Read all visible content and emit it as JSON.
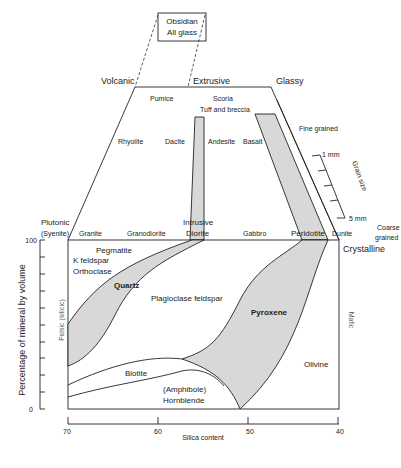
{
  "obsidian_box": {
    "line1": "Obsidian",
    "line2": "All glass"
  },
  "top_labels": {
    "volcanic": "Volcanic",
    "extrusive": "Extrusive",
    "glassy": "Glassy"
  },
  "volcanic_rocks": {
    "pumice": "Pumice",
    "scoria": "Scoria",
    "tuff": "Tuff and breccia",
    "rhyolite": "Rhyolite",
    "dacite": "Dacite",
    "andesite": "Andesite",
    "basalt": "Basalt"
  },
  "grain": {
    "fine": "Fine grained",
    "mm1": "1 mm",
    "mm5": "5 mm",
    "label": "Grain size",
    "coarse1": "Coarse",
    "coarse2": "grained"
  },
  "plutonic_rocks": {
    "plutonic": "Plutonic",
    "syenite": "(Syenite)",
    "granite": "Granite",
    "granodiorite": "Granodiorite",
    "intrusive": "Intrusive",
    "diorite": "Diorite",
    "gabbro": "Gabbro",
    "peridotite": "Peridotite",
    "dunite": "Dunite",
    "crystalline": "Crystalline"
  },
  "minerals": {
    "pegmatite": "Pegmatite",
    "kfeldspar": "K feldspar",
    "orthoclase": "Orthoclase",
    "quartz": "Quartz",
    "plagioclase": "Plagioclase feldspar",
    "pyroxene": "Pyroxene",
    "biotite": "Biotite",
    "amphibole": "(Amphibole)",
    "hornblende": "Hornblende",
    "olivine": "Olivine"
  },
  "axes": {
    "ylabel": "Percentage of mineral by volume",
    "felsic": "Felsic (silicic)",
    "mafic": "Mafic",
    "y_ticks": [
      "100",
      "0"
    ],
    "x_ticks": [
      "70",
      "60",
      "50",
      "40"
    ],
    "xlabel": "Silica content"
  }
}
